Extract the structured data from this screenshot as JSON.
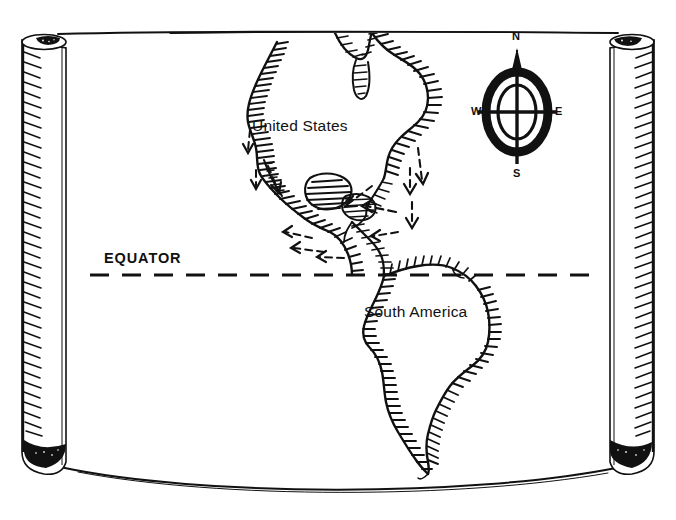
{
  "figure": {
    "kind": "hand-drawn-scroll-map",
    "background_color": "#ffffff",
    "ink_color": "#111111",
    "width": 676,
    "height": 520
  },
  "map": {
    "labels": {
      "united_states": "United States",
      "south_america": "South America",
      "equator": "EQUATOR"
    },
    "equator_line": {
      "style": "dashed",
      "y": 275,
      "x_start": 90,
      "x_end": 602
    },
    "landmasses": [
      "North America",
      "Central America",
      "Caribbean islands",
      "South America"
    ],
    "arrows": {
      "style": "dashed migration arrows",
      "count": 11,
      "description": "dashed arrows pointing south and west along the Pacific coast, through Central America and the Caribbean"
    }
  },
  "compass": {
    "name": "compass-rose",
    "north": "N",
    "south": "S",
    "east": "E",
    "west": "W",
    "shape": "oval rose with vertical north arrow",
    "center_x": 517,
    "center_y": 112
  },
  "scroll": {
    "left_roll": "rolled parchment edge",
    "right_roll": "rolled parchment edge",
    "top_edge": "straight",
    "bottom_edge": "sagging curve"
  }
}
